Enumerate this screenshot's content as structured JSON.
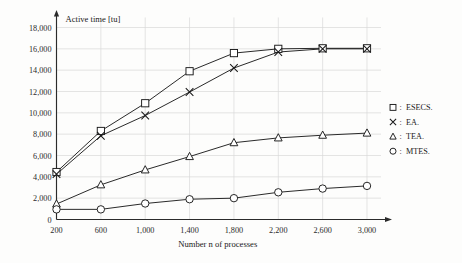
{
  "chart_data": {
    "type": "line",
    "title": "Active time [tu]",
    "xlabel": "Number n of processes",
    "ylabel": "Active time [tu]",
    "x": [
      200,
      600,
      1000,
      1400,
      1800,
      2200,
      2600,
      3000
    ],
    "xtick_labels": [
      "200",
      "600",
      "1,000",
      "1,400",
      "1,800",
      "2,200",
      "2,600",
      "3,000"
    ],
    "ytick_labels": [
      "0",
      "2,000",
      "4,000",
      "6,000",
      "8,000",
      "10,000",
      "12,000",
      "14,000",
      "16,000",
      "18,000"
    ],
    "ytick_values": [
      0,
      2000,
      4000,
      6000,
      8000,
      10000,
      12000,
      14000,
      16000,
      18000
    ],
    "xlim": [
      200,
      3000
    ],
    "ylim": [
      0,
      18000
    ],
    "grid": true,
    "legend_position": "right",
    "series": [
      {
        "name": "ESECS.",
        "marker": "square",
        "color": "#1a1a1a",
        "values": [
          4450,
          8300,
          10900,
          13900,
          15600,
          16000,
          16050,
          16050
        ]
      },
      {
        "name": "EA.",
        "marker": "x",
        "color": "#1a1a1a",
        "values": [
          4250,
          7850,
          9750,
          11950,
          14200,
          15700,
          16000,
          16000
        ]
      },
      {
        "name": "TEA.",
        "marker": "triangle",
        "color": "#1a1a1a",
        "values": [
          1450,
          3250,
          4650,
          5900,
          7200,
          7650,
          7900,
          8100
        ]
      },
      {
        "name": "MTES.",
        "marker": "circle",
        "color": "#1a1a1a",
        "values": [
          950,
          950,
          1500,
          1900,
          2000,
          2550,
          2900,
          3150
        ]
      }
    ]
  },
  "legend": {
    "separator": ":",
    "entries": [
      {
        "marker": "square",
        "label": "ESECS."
      },
      {
        "marker": "x",
        "label": "EA."
      },
      {
        "marker": "triangle",
        "label": "TEA."
      },
      {
        "marker": "circle",
        "label": "MTES."
      }
    ]
  }
}
